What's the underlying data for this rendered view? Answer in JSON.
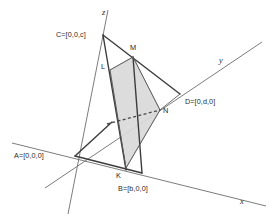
{
  "figure": {
    "background_color": "#ffffff",
    "shade_color": "#d9d9d9",
    "line_color": "#3c3c3c",
    "axis_color": "#6d6d6d"
  },
  "axes": [
    {
      "name": "z",
      "label": "z",
      "label_x": 103,
      "label_y": 13
    },
    {
      "name": "y",
      "label": "y",
      "label_x": 220,
      "label_y": 62
    },
    {
      "name": "x",
      "label": "x",
      "label_x": 240,
      "label_y": 202
    }
  ],
  "vertices": [
    {
      "key": "A",
      "label": "A=[0,0,0]",
      "x": 75,
      "y": 156,
      "label_x": 14,
      "label_y": 153
    },
    {
      "key": "B",
      "label": "B=[b,0,0]",
      "x": 140,
      "y": 173,
      "label_x": 118,
      "label_y": 185
    },
    {
      "key": "C",
      "label": "C=[0,0,c]",
      "x": 103,
      "y": 35,
      "label_x": 57,
      "label_y": 31
    },
    {
      "key": "D",
      "label": "D=[0,d,0]",
      "x": 180,
      "y": 94,
      "label_x": 185,
      "label_y": 99
    }
  ],
  "section_points": [
    {
      "key": "K",
      "label": "K",
      "x": 122,
      "y": 168,
      "label_x": 117,
      "label_y": 172
    },
    {
      "key": "L",
      "label": "L",
      "x": 110,
      "y": 70,
      "label_x": 102,
      "label_y": 67
    },
    {
      "key": "M",
      "label": "M",
      "x": 133,
      "y": 57,
      "label_x": 131,
      "label_y": 46
    },
    {
      "key": "N",
      "label": "N",
      "x": 160,
      "y": 110,
      "label_x": 162,
      "label_y": 110
    }
  ],
  "shaded_polygon": {
    "name": "cross-section-KLMN",
    "points": "110,70 133,57 160,110 126,168"
  },
  "dashed_segment": {
    "name": "hidden-edge-A-to-N",
    "x1": 107,
    "y1": 124,
    "x2": 160,
    "y2": 110
  }
}
